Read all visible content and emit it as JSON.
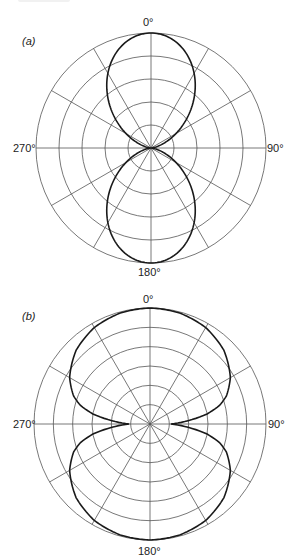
{
  "chart_data": [
    {
      "type": "line",
      "subtype": "polar",
      "panel_label": "(a)",
      "angle_labels": {
        "top": "0°",
        "right": "90°",
        "bottom": "180°",
        "left": "270°"
      },
      "rings": 5,
      "spoke_step_deg": 30,
      "formula": "r = cos^2(theta)",
      "theta_deg": [
        0,
        15,
        30,
        45,
        60,
        75,
        90,
        105,
        120,
        135,
        150,
        165,
        180,
        195,
        210,
        225,
        240,
        255,
        270,
        285,
        300,
        315,
        330,
        345,
        360
      ],
      "r": [
        1.0,
        0.93,
        0.75,
        0.5,
        0.25,
        0.07,
        0.0,
        0.07,
        0.25,
        0.5,
        0.75,
        0.93,
        1.0,
        0.93,
        0.75,
        0.5,
        0.25,
        0.07,
        0.0,
        0.07,
        0.25,
        0.5,
        0.75,
        0.93,
        1.0
      ],
      "geometry": {
        "cx": 151,
        "cy": 148,
        "R": 115
      }
    },
    {
      "type": "line",
      "subtype": "polar",
      "panel_label": "(b)",
      "angle_labels": {
        "top": "0°",
        "right": "90°",
        "bottom": "180°",
        "left": "270°"
      },
      "rings": 6,
      "spoke_step_deg": 30,
      "theta_deg": [
        0,
        15,
        30,
        45,
        60,
        70,
        75,
        80,
        85,
        90,
        95,
        100,
        105,
        110,
        120,
        135,
        150,
        165,
        180,
        195,
        210,
        225,
        240,
        250,
        255,
        260,
        265,
        270,
        275,
        280,
        285,
        290,
        300,
        315,
        330,
        345,
        360
      ],
      "r": [
        1.0,
        0.99,
        0.96,
        0.9,
        0.8,
        0.7,
        0.62,
        0.5,
        0.33,
        0.18,
        0.33,
        0.5,
        0.62,
        0.7,
        0.8,
        0.9,
        0.96,
        0.99,
        1.0,
        0.99,
        0.96,
        0.9,
        0.8,
        0.7,
        0.62,
        0.5,
        0.33,
        0.18,
        0.33,
        0.5,
        0.62,
        0.7,
        0.8,
        0.9,
        0.96,
        0.99,
        1.0
      ],
      "geometry": {
        "cx": 150,
        "cy": 424,
        "R": 116
      }
    }
  ]
}
